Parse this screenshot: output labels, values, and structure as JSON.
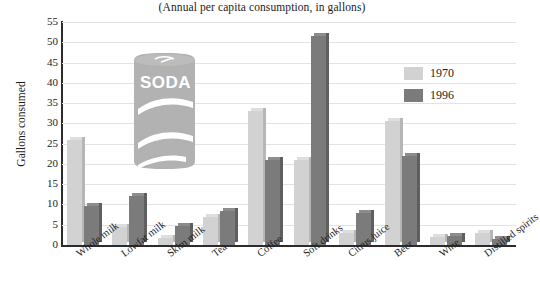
{
  "chart_data": {
    "type": "bar",
    "title": "(Annual per capita consumption, in gallons)",
    "xlabel": "",
    "ylabel": "Gallons consumed",
    "ylim": [
      0,
      55
    ],
    "ytick_step": 5,
    "yticks": [
      "55",
      "50",
      "45",
      "40",
      "35",
      "30",
      "25",
      "20",
      "15",
      "10",
      "5",
      "0"
    ],
    "grid": true,
    "legend_position": "top-right",
    "categories": [
      "Whole milk",
      "Lowfat milk",
      "Skim milk",
      "Tea",
      "Coffee",
      "Soft drinks",
      "Citrus juice",
      "Beer",
      "Wine",
      "Distilled spirits"
    ],
    "series": [
      {
        "name": "1970",
        "color": "#d2d2d2",
        "values": [
          25.8,
          4.5,
          1.7,
          7.0,
          33.0,
          21.0,
          3.0,
          30.5,
          2.0,
          3.0
        ]
      },
      {
        "name": "1996",
        "color": "#7b7b7b",
        "values": [
          9.5,
          12.0,
          4.6,
          8.5,
          21.0,
          51.5,
          8.0,
          22.0,
          2.3,
          1.5
        ]
      }
    ]
  },
  "legend": {
    "items": [
      {
        "label": "1970",
        "color": "#d2d2d2"
      },
      {
        "label": "1996",
        "color": "#7b7b7b"
      }
    ]
  },
  "illustration": {
    "name": "soda-can",
    "label": "SODA",
    "body_color": "#b2b2b2",
    "stripe_color": "#ffffff"
  }
}
